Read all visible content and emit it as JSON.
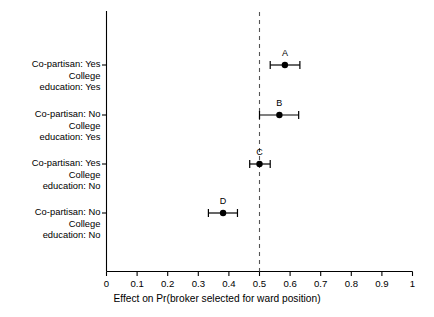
{
  "chart_data": {
    "type": "scatter",
    "title": "",
    "xlabel": "Effect on Pr(broker selected for ward position)",
    "ylabel": "",
    "xlim": [
      0,
      1
    ],
    "xticks": [
      "0",
      "0.1",
      "0.2",
      "0.3",
      "0.4",
      "0.5",
      "0.6",
      "0.7",
      "0.8",
      "0.9",
      "1"
    ],
    "xtick_values": [
      0,
      0.1,
      0.2,
      0.3,
      0.4,
      0.5,
      0.6,
      0.7,
      0.8,
      0.9,
      1
    ],
    "grid": false,
    "legend": "none",
    "orientation": "horizontal",
    "reference_line": {
      "value": 0.5,
      "style": "dashed",
      "color": "#555555"
    },
    "categories": [
      {
        "id": "A",
        "lines": [
          "Co-partisan: Yes",
          "College",
          "education: Yes"
        ],
        "estimate": 0.583,
        "ci_low": 0.535,
        "ci_high": 0.632
      },
      {
        "id": "B",
        "lines": [
          "Co-partisan: No",
          "College",
          "education: Yes"
        ],
        "estimate": 0.565,
        "ci_low": 0.5,
        "ci_high": 0.628
      },
      {
        "id": "C",
        "lines": [
          "Co-partisan: Yes",
          "College",
          "education: No"
        ],
        "estimate": 0.5,
        "ci_low": 0.468,
        "ci_high": 0.535
      },
      {
        "id": "D",
        "lines": [
          "Co-partisan: No",
          "College",
          "education: No"
        ],
        "estimate": 0.381,
        "ci_low": 0.333,
        "ci_high": 0.428
      }
    ],
    "point_color": "#000000",
    "axis_color": "#000000"
  }
}
